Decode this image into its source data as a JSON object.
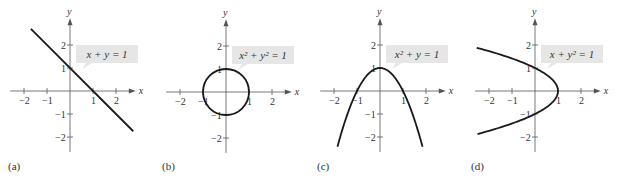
{
  "figure": {
    "panels": [
      {
        "id": "a",
        "label": "(a)",
        "equation": "x + y = 1",
        "equation_parts": [
          [
            "x + y = 1",
            ""
          ]
        ],
        "curve": "line",
        "origin": [
          70,
          91
        ]
      },
      {
        "id": "b",
        "label": "(b)",
        "equation": "x² + y² = 1",
        "curve": "circle",
        "origin": [
          226,
          92
        ]
      },
      {
        "id": "c",
        "label": "(c)",
        "equation": "x² + y = 1",
        "curve": "parabola-down",
        "origin": [
          380,
          91
        ]
      },
      {
        "id": "d",
        "label": "(d)",
        "equation": "x + y² = 1",
        "curve": "parabola-left",
        "origin": [
          535,
          91
        ]
      }
    ],
    "axes": {
      "x_label": "x",
      "y_label": "y",
      "x_ticks": [
        "−2",
        "−1",
        "1",
        "2"
      ],
      "y_ticks": [
        "2",
        "1",
        "−1",
        "−2"
      ],
      "unit_px": 23
    },
    "colors": {
      "curve": "#1a1a1a",
      "axis": "#555555",
      "label_box": "#e6e6e6"
    }
  },
  "chart_data": [
    {
      "type": "line",
      "title": "(a) x + y = 1",
      "xlabel": "x",
      "ylabel": "y",
      "xlim": [
        -2.5,
        2.5
      ],
      "ylim": [
        -2.5,
        2.5
      ],
      "x": [
        -1.7,
        2.7
      ],
      "y": [
        2.7,
        -1.7
      ],
      "annotation": "x + y = 1"
    },
    {
      "type": "line",
      "title": "(b) x² + y² = 1",
      "xlabel": "x",
      "ylabel": "y",
      "xlim": [
        -2.5,
        2.5
      ],
      "ylim": [
        -2.5,
        2.5
      ],
      "shape": "circle",
      "center": [
        0,
        0
      ],
      "radius": 1,
      "annotation": "x² + y² = 1"
    },
    {
      "type": "line",
      "title": "(c) x² + y = 1",
      "xlabel": "x",
      "ylabel": "y",
      "xlim": [
        -2.5,
        2.5
      ],
      "ylim": [
        -2.5,
        2.5
      ],
      "x": [
        -1.8,
        -1,
        0,
        1,
        1.8
      ],
      "y": [
        -2.24,
        0,
        1,
        0,
        -2.24
      ],
      "annotation": "x² + y = 1"
    },
    {
      "type": "line",
      "title": "(d) x + y² = 1",
      "xlabel": "x",
      "ylabel": "y",
      "xlim": [
        -2.5,
        2.5
      ],
      "ylim": [
        -2.5,
        2.5
      ],
      "x": [
        -2.4,
        0,
        1,
        0,
        -2.4
      ],
      "y": [
        1.84,
        1,
        0,
        -1,
        -1.84
      ],
      "annotation": "x + y² = 1"
    }
  ]
}
